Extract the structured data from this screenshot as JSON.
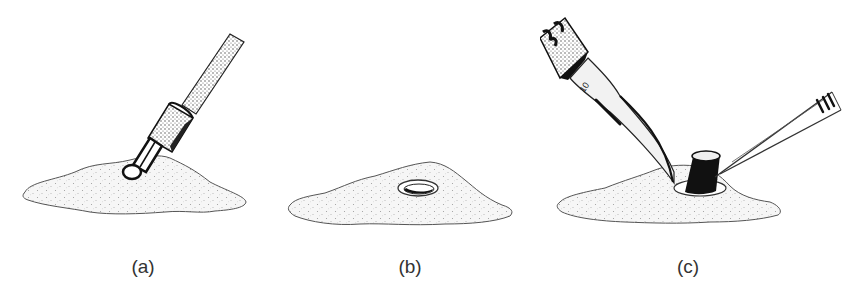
{
  "figure": {
    "panels": [
      {
        "id": "a",
        "label": "(a)",
        "description": "cylindrical punch tool pressed into skin surface"
      },
      {
        "id": "b",
        "label": "(b)",
        "description": "circular punched incision in skin surface"
      },
      {
        "id": "c",
        "label": "(c)",
        "description": "scalpel and forceps excising cylindrical tissue core"
      }
    ],
    "blade_marking": "10",
    "colors": {
      "ink": "#1a1a1a",
      "skin_fill": "#f4f4f4",
      "stipple": "#9a9a9a",
      "background": "#ffffff"
    }
  }
}
